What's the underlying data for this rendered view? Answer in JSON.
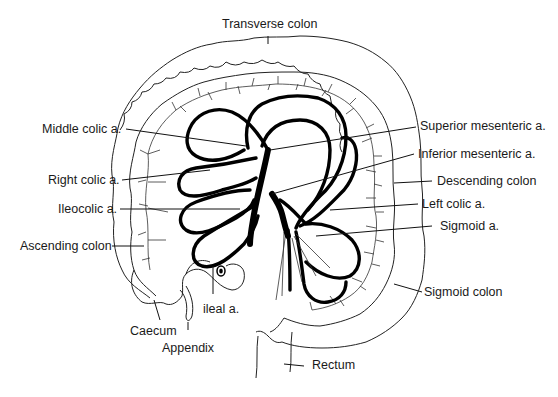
{
  "labels": {
    "transverse_colon": "Transverse colon",
    "middle_colic": "Middle colic a.",
    "right_colic": "Right colic a.",
    "ileocolic": "Ileocolic a.",
    "ascending_colon": "Ascending colon",
    "caecum": "Caecum",
    "appendix": "Appendix",
    "ileal": "ileal a.",
    "superior_mesenteric": "Superior mesenteric a.",
    "inferior_mesenteric": "Inferior mesenteric a.",
    "descending_colon": "Descending colon",
    "left_colic": "Left colic a.",
    "sigmoid_a": "Sigmoid a.",
    "sigmoid_colon": "Sigmoid colon",
    "rectum": "Rectum"
  },
  "colors": {
    "line": "#000000",
    "text": "#1a1a1a",
    "background": "#ffffff"
  }
}
